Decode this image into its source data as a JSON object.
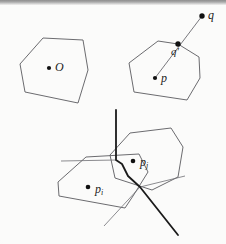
{
  "figure": {
    "background_color": "#fbfbfa",
    "stroke_color": "#55555a",
    "thick_stroke_color": "#1a1a1a",
    "point_color": "#111111"
  },
  "panels": {
    "left": {
      "name": "polygon-with-center",
      "polygon_points": "43,38 83,40 88,70 78,103 25,92 20,64",
      "point": {
        "cx": 49,
        "cy": 68,
        "r": 2.1
      },
      "label": {
        "text": "O",
        "x": 55,
        "y": 62
      }
    },
    "middle": {
      "name": "polygon-with-ray",
      "polygon_points": "158,41 178,44 199,57 200,78 187,100 134,92 129,63",
      "point_p": {
        "cx": 155,
        "cy": 78,
        "r": 2.1
      },
      "label_p": {
        "text": "p",
        "x": 161,
        "y": 79
      },
      "point_qprime": {
        "cx": 178,
        "cy": 44,
        "r": 2.6
      },
      "label_qprime": {
        "text": "q′",
        "x": 172,
        "y": 46
      },
      "point_q": {
        "cx": 202,
        "cy": 16,
        "r": 2.6
      },
      "label_q": {
        "text": "q",
        "x": 208,
        "y": 15
      },
      "ray": {
        "x1": 155,
        "y1": 78,
        "x2": 202,
        "y2": 16
      }
    },
    "bottom": {
      "name": "two-overlapping-polygons",
      "polygon_i_points": "86,157 139,154 148,172 133,196 125,208 59,196 58,182",
      "polygon_j_points": "130,133 171,128 183,147 178,177 152,190 115,178 110,155",
      "point_pi": {
        "cx": 88,
        "cy": 187,
        "r": 2.3
      },
      "label_pi": {
        "text": "p",
        "sub": "i",
        "x": 95,
        "y": 189
      },
      "point_pj": {
        "cx": 133,
        "cy": 161,
        "r": 2.3
      },
      "label_pj": {
        "text": "p",
        "sub": "j",
        "x": 140,
        "y": 162
      },
      "separator_path": "M 116,110 L 116,160 L 122,164 L 128,176 L 140,187 L 178,235",
      "thin_ray_a": {
        "x1": 116,
        "y1": 160,
        "x2": 61,
        "y2": 161
      },
      "thin_ray_b": {
        "x1": 140,
        "y1": 187,
        "x2": 104,
        "y2": 226
      },
      "thin_ray_c": {
        "x1": 140,
        "y1": 187,
        "x2": 185,
        "y2": 176
      }
    }
  },
  "labels": {
    "o": "O",
    "p": "p",
    "q": "q",
    "q_prime": "q′",
    "p_i_base": "p",
    "p_i_sub": "i",
    "p_j_base": "p",
    "p_j_sub": "j"
  }
}
